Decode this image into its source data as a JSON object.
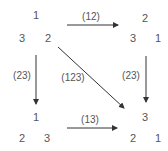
{
  "diagram": {
    "type": "permutation-transformation-diagram",
    "states": [
      {
        "id": "top-left",
        "top": "1",
        "bottom_left": "3",
        "bottom_right": "2"
      },
      {
        "id": "top-right",
        "top": "2",
        "bottom_left": "3",
        "bottom_right": "1"
      },
      {
        "id": "bottom-left",
        "top": "1",
        "bottom_left": "2",
        "bottom_right": "3"
      },
      {
        "id": "bottom-right",
        "top": "3",
        "bottom_left": "2",
        "bottom_right": "1"
      }
    ],
    "arrows": [
      {
        "id": "top",
        "from": "top-left",
        "to": "top-right",
        "label": "(12)"
      },
      {
        "id": "left",
        "from": "top-left",
        "to": "bottom-left",
        "label": "(23)"
      },
      {
        "id": "right",
        "from": "top-right",
        "to": "bottom-right",
        "label": "(23)"
      },
      {
        "id": "diagonal",
        "from": "top-left",
        "to": "bottom-right",
        "label": "(123)"
      },
      {
        "id": "bottom",
        "from": "bottom-left",
        "to": "bottom-right",
        "label": "(13)"
      }
    ],
    "colors": {
      "arrow": "#333333",
      "text": "#555555"
    }
  }
}
